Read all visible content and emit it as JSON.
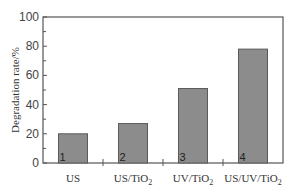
{
  "chart_data": {
    "type": "bar",
    "title": "",
    "xlabel": "",
    "ylabel": "Degradation rate/%",
    "ylim": [
      0,
      100
    ],
    "yticks": [
      0,
      20,
      40,
      60,
      80,
      100
    ],
    "grid": false,
    "legend": null,
    "categories": [
      "US",
      "US/TiO2",
      "UV/TiO2",
      "US/UV/TiO2"
    ],
    "category_display": [
      {
        "main": "US",
        "sub": ""
      },
      {
        "main": "US/TiO",
        "sub": "2"
      },
      {
        "main": "UV/TiO",
        "sub": "2"
      },
      {
        "main": "US/UV/TiO",
        "sub": "2"
      }
    ],
    "bar_labels": [
      "1",
      "2",
      "3",
      "4"
    ],
    "values": [
      20,
      27,
      51,
      78
    ],
    "bar_color": "#8c8c8c",
    "bar_edge_color": "#5a5a5a"
  }
}
